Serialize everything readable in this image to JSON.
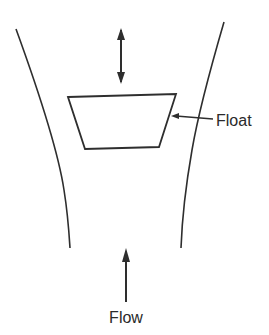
{
  "diagram": {
    "labels": {
      "float": "Float",
      "flow": "Flow"
    },
    "components": {
      "tube": {
        "description": "Tapered tube, wider at top"
      },
      "float": {
        "description": "Trapezoidal float"
      },
      "motion_arrow": {
        "description": "Double-headed arrow indicating vertical float motion"
      },
      "flow_arrow": {
        "description": "Upward arrow indicating flow direction"
      }
    },
    "colors": {
      "line": "#2e2e2e",
      "text": "#2a2a2a",
      "background": "#ffffff"
    }
  }
}
